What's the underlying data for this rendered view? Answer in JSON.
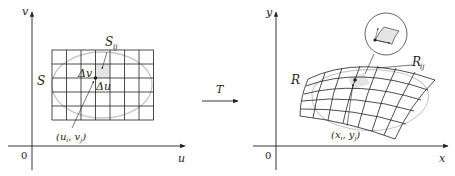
{
  "figure": {
    "left_panel": {
      "axis_vertical_label": "v",
      "axis_horizontal_label": "u",
      "origin_label": "0",
      "region_label": "S",
      "subrect_label": "S",
      "subrect_subscript": "ij",
      "delta_v_label": "Δv",
      "delta_u_label": "Δu",
      "point_label": "(u",
      "point_label_i": "i",
      "point_label_mid": ", v",
      "point_label_j": "j",
      "point_label_end": ")",
      "grid_columns": 7,
      "grid_rows": 5
    },
    "transform": {
      "label": "T"
    },
    "right_panel": {
      "axis_vertical_label": "y",
      "axis_horizontal_label": "x",
      "origin_label": "0",
      "region_label": "R",
      "subregion_label": "R",
      "subregion_subscript": "ij",
      "point_label": "(x",
      "point_label_i": "i",
      "point_label_mid": ", y",
      "point_label_j": "j",
      "point_label_end": ")",
      "grid_columns": 7,
      "grid_rows": 5
    },
    "colors": {
      "ink": "#231f20",
      "region_outline": "#c8c8c8",
      "shade": "#e4e4e4"
    }
  }
}
